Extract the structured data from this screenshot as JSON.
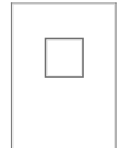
{
  "canvas": {
    "width": 124,
    "height": 148,
    "background_color": "#ffffff"
  },
  "drawing": {
    "title": "Rectangle with centered square",
    "stroke_color": "#7d7d7d",
    "inner_stroke_color": "#6e6e6e",
    "shapes": [
      {
        "name": "outer-rectangle",
        "type": "rectangle",
        "x": 11.5,
        "y": 3.0,
        "width": 104.5,
        "height": 148.0,
        "stroke_width": 1.2,
        "fill": "none",
        "bottom_edge_visible": false
      },
      {
        "name": "inner-square",
        "type": "rectangle",
        "x": 45.5,
        "y": 38.5,
        "width": 37.5,
        "height": 38.5,
        "stroke_width": 1.6,
        "fill": "none",
        "bottom_edge_visible": true
      }
    ]
  }
}
